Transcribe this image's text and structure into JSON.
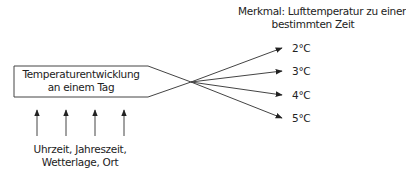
{
  "diagram": {
    "box_label_line1": "Temperaturentwicklung",
    "box_label_line2": "an einem Tag",
    "feature_label_line1": "Merkmal: Lufttemperatur zu einer",
    "feature_label_line2": "bestimmten Zeit",
    "outcomes": [
      "2°C",
      "3°C",
      "4°C",
      "5°C"
    ],
    "factors_line1": "Uhrzeit, Jahreszeit,",
    "factors_line2": "Wetterlage, Ort"
  },
  "colors": {
    "stroke": "#333333",
    "text": "#222222"
  }
}
